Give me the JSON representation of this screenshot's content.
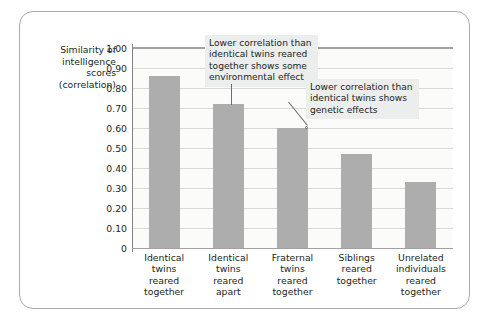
{
  "chart_data": {
    "type": "bar",
    "title": "",
    "xlabel": "",
    "ylabel": "Similarity of intelligence scores (correlation)",
    "ylabel_lines": [
      "Similarity of",
      "intelligence",
      "scores",
      "(correlation)"
    ],
    "ylim": [
      0,
      1.0
    ],
    "ytick_labels": [
      "1.00",
      "0.90",
      "0.80",
      "0.70",
      "0.60",
      "0.50",
      "0.40",
      "0.30",
      "0.20",
      "0.10",
      "0"
    ],
    "ytick_values": [
      1.0,
      0.9,
      0.8,
      0.7,
      0.6,
      0.5,
      0.4,
      0.3,
      0.2,
      0.1,
      0
    ],
    "grid": true,
    "legend": "none",
    "bar_color": "#adadad",
    "categories": [
      "Identical twins reared together",
      "Identical twins reared apart",
      "Fraternal twins reared together",
      "Siblings reared together",
      "Unrelated individuals reared together"
    ],
    "category_lines": [
      [
        "Identical",
        "twins",
        "reared",
        "together"
      ],
      [
        "Identical",
        "twins",
        "reared",
        "apart"
      ],
      [
        "Fraternal",
        "twins",
        "reared",
        "together"
      ],
      [
        "Siblings",
        "reared",
        "together"
      ],
      [
        "Unrelated",
        "individuals",
        "reared",
        "together"
      ]
    ],
    "values": [
      0.86,
      0.72,
      0.6,
      0.47,
      0.33
    ],
    "annotations": [
      {
        "id": "annotation-environmental-effect",
        "text": "Lower correlation than identical twins reared together shows some environmental effect",
        "points_to_category": "Identical twins reared apart"
      },
      {
        "id": "annotation-genetic-effects",
        "text": "Lower correlation than identical twins shows genetic effects",
        "points_to_category": "Fraternal twins reared together"
      }
    ]
  },
  "colors": {
    "bar": "#adadad",
    "frame_border": "#a7a9ac",
    "gridline": "#d9d9d6",
    "axis": "#808285",
    "plot_background": "#fbfbfa",
    "annotation_background": "#eceded",
    "text": "#231f20"
  }
}
